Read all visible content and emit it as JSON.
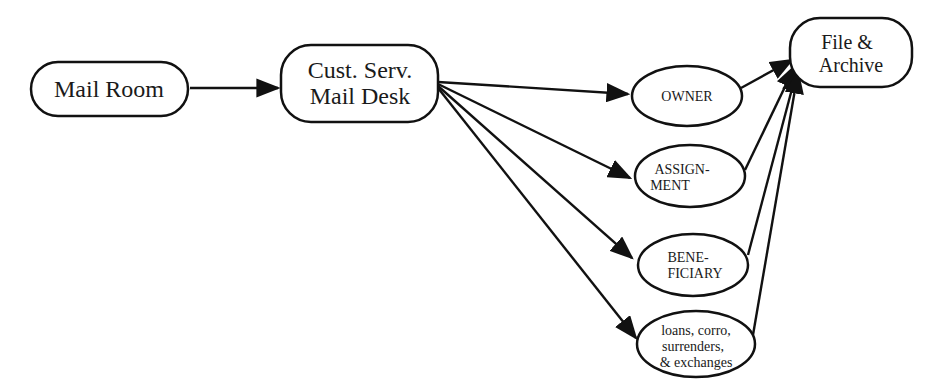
{
  "diagram": {
    "type": "flowchart",
    "nodes": {
      "mail_room": {
        "label": "Mail Room"
      },
      "cust_serv": {
        "line1": "Cust. Serv.",
        "line2": "Mail Desk"
      },
      "owner": {
        "label": "OWNER"
      },
      "assignment": {
        "line1": "ASSIGN-",
        "line2": "MENT"
      },
      "beneficiary": {
        "line1": "BENE-",
        "line2": "FICIARY"
      },
      "loans": {
        "line1": "loans, corro,",
        "line2": "surrenders,",
        "line3": "& exchanges"
      },
      "file_archive": {
        "line1": "File &",
        "line2": "Archive"
      }
    },
    "edges": [
      {
        "from": "Mail Room",
        "to": "Cust. Serv. Mail Desk"
      },
      {
        "from": "Cust. Serv. Mail Desk",
        "to": "OWNER"
      },
      {
        "from": "Cust. Serv. Mail Desk",
        "to": "ASSIGNMENT"
      },
      {
        "from": "Cust. Serv. Mail Desk",
        "to": "BENEFICIARY"
      },
      {
        "from": "Cust. Serv. Mail Desk",
        "to": "loans, corro, surrenders, & exchanges"
      },
      {
        "from": "OWNER",
        "to": "File & Archive"
      },
      {
        "from": "ASSIGNMENT",
        "to": "File & Archive"
      },
      {
        "from": "BENEFICIARY",
        "to": "File & Archive"
      },
      {
        "from": "loans, corro, surrenders, & exchanges",
        "to": "File & Archive"
      }
    ]
  }
}
